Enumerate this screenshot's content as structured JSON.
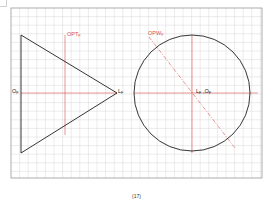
{
  "figure": {
    "caption": "(17)",
    "colors": {
      "grid": "#d4d4d4",
      "frame": "#9a9a9a",
      "outline": "#1f1f1f",
      "construction": "#d9534f",
      "background": "#ffffff"
    },
    "grid": {
      "x0": 11,
      "y0": 8,
      "x1": 262,
      "y1": 178,
      "step": 8.6
    },
    "left_view": {
      "shape": "triangle",
      "vertices": [
        [
          21,
          35
        ],
        [
          21,
          153
        ],
        [
          117,
          93
        ]
      ],
      "label_apex_left": {
        "main": "O",
        "sub": "F"
      },
      "label_apex_right": {
        "main": "L",
        "sub": "F"
      },
      "plane_label": {
        "main": "OPT",
        "sub": "F"
      }
    },
    "right_view": {
      "shape": "circle",
      "center": [
        192,
        93
      ],
      "radius": 58,
      "center_label": {
        "main": "L",
        "sub": "F",
        "sep": " ,",
        "main2": "O",
        "sub2": "F"
      },
      "plane_label": {
        "main": "OPW",
        "sub": "F"
      }
    }
  }
}
